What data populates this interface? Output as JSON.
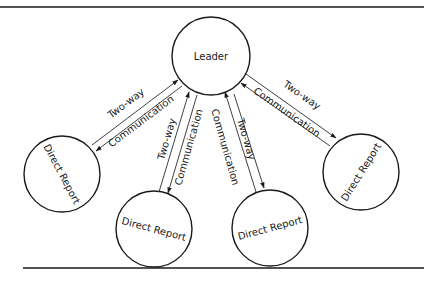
{
  "diagram": {
    "type": "hub-and-spoke communication diagram",
    "center_node": {
      "id": "leader",
      "label": "Leader"
    },
    "nodes": [
      {
        "id": "dr1",
        "label": "Direct Report"
      },
      {
        "id": "dr2",
        "label": "Direct Report"
      },
      {
        "id": "dr3",
        "label": "Direct Report"
      },
      {
        "id": "dr4",
        "label": "Direct Report"
      }
    ],
    "edges": [
      {
        "from": "leader",
        "to": "dr1",
        "label_a": "Two-way",
        "label_b": "Communication",
        "bidirectional": true
      },
      {
        "from": "leader",
        "to": "dr2",
        "label_a": "Two-way",
        "label_b": "Communication",
        "bidirectional": true
      },
      {
        "from": "leader",
        "to": "dr3",
        "label_a": "Communication",
        "label_b": "Two-way",
        "bidirectional": true
      },
      {
        "from": "leader",
        "to": "dr4",
        "label_a": "Two-way",
        "label_b": "Communication",
        "bidirectional": true
      }
    ]
  }
}
